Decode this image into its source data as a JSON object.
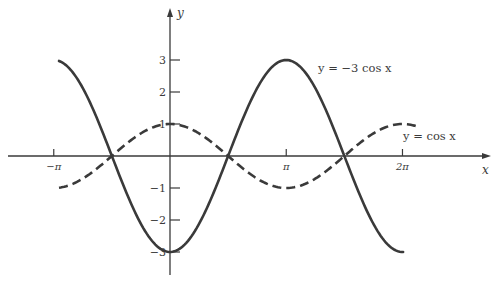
{
  "chart_data": {
    "type": "line",
    "title": "",
    "xlabel": "x",
    "ylabel": "y",
    "x_ticks": [
      {
        "value": -3.14159,
        "label": "−π"
      },
      {
        "value": 3.14159,
        "label": "π"
      },
      {
        "value": 6.28318,
        "label": "2π"
      }
    ],
    "y_ticks": [
      {
        "value": 3,
        "label": "3"
      },
      {
        "value": 2,
        "label": "2"
      },
      {
        "value": 1,
        "label": "1"
      },
      {
        "value": -1,
        "label": "−1"
      },
      {
        "value": -2,
        "label": "−2"
      },
      {
        "value": -3,
        "label": "−3"
      }
    ],
    "xlim": [
      -4.5,
      8.7
    ],
    "ylim": [
      -3.6,
      4.6
    ],
    "grid": false,
    "legend": "inline annotations",
    "series": [
      {
        "name": "y = −3 cos x",
        "function": "-3*cos(x)",
        "style": "solid",
        "x_range": [
          -3.0,
          6.3
        ],
        "color": "#3a3a3a",
        "annotation": {
          "text": "y = −3 cos x",
          "x": 4.0,
          "y": 3.0
        }
      },
      {
        "name": "y = cos x",
        "function": "cos(x)",
        "style": "dashed",
        "x_range": [
          -3.0,
          6.7
        ],
        "color": "#3a3a3a",
        "annotation": {
          "text": "y = cos x",
          "x": 7.0,
          "y": 1.0
        }
      }
    ],
    "sample_points": {
      "x": [
        -3.14159,
        -1.5708,
        0,
        1.5708,
        3.14159,
        4.71239,
        6.28318
      ],
      "neg3cos": [
        3,
        0,
        -3,
        0,
        3,
        0,
        -3
      ],
      "cos": [
        -1,
        0,
        1,
        0,
        -1,
        0,
        1
      ]
    }
  },
  "labels": {
    "x_axis": "x",
    "y_axis": "y",
    "series1": "y = −3 cos x",
    "series2": "y = cos x"
  },
  "colors": {
    "ink": "#3a3a3a",
    "background": "#ffffff"
  }
}
